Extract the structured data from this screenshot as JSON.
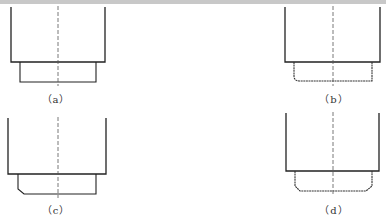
{
  "figure": {
    "panels": [
      {
        "id": "a",
        "label": "（a）",
        "description": "Cup with straight cylindrical bottom step, square corners"
      },
      {
        "id": "b",
        "label": "（b）",
        "description": "Cup with bottom step, rounded lower-left corner"
      },
      {
        "id": "c",
        "label": "（c）",
        "description": "Cup with bottom step, chamfered lower-left corner"
      },
      {
        "id": "d",
        "label": "（d）",
        "description": "Cup with bottom step, chamfered lower corners on both sides"
      }
    ],
    "colors": {
      "line": "#222222",
      "centerline": "#555555",
      "dashed_edge": "#666666",
      "topbar": "#c8c8c8"
    }
  }
}
